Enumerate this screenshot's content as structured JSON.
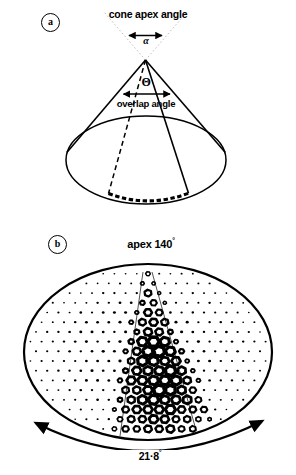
{
  "figure": {
    "background_color": "#ffffff",
    "ink_color": "#000000",
    "width": 296,
    "height": 475
  },
  "panel_a": {
    "letter": "a",
    "cone_apex_angle_label": "cone apex angle",
    "apex_angle_symbol": "α",
    "overlap_angle_symbol": "Θ",
    "overlap_angle_label": "overlap angle",
    "description": "Cone drawn in perspective with elliptical base; dotted guide lines above apex bound the cone apex angle; a dashed generatrix and a solid generatrix bound the overlap angle wedge; a thick dashed arc marks the subtended base arc.",
    "elements": {
      "apex_point": "cone-apex",
      "base_ellipse": "cone-base-ellipse",
      "dashed_generatrix": "cone-dashed-edge",
      "solid_generatrix": "cone-solid-edge",
      "apex_arrow": "alpha-double-arrow",
      "overlap_arrow": "theta-double-arrow",
      "subtended_arc": "overlap-base-arc"
    }
  },
  "panel_b": {
    "letter": "b",
    "apex_label": "apex 140",
    "apex_degree_symbol": "°",
    "span_label": "21·8",
    "span_degree_symbol": "°",
    "description": "Elliptical compound-eye surface filled with a hexagonal array of facets; facets are small filled dots near the periphery and grow into large hollow hexagonal rings within a wedge running from the top centre down to the lower edge; a curved double-headed arrow beneath the ellipse spans the marked angle.",
    "array": {
      "lattice": "hexagonal",
      "rows": 26,
      "facet_style_small": "filled-dot",
      "facet_style_large": "hollow-hexagon-ring"
    }
  }
}
